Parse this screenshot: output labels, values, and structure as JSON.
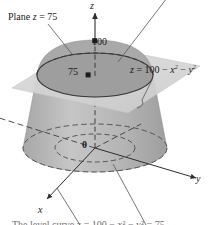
{
  "figure": {
    "labels": {
      "plane_label": "Plane z = 75",
      "surface_equation_lhs": "z = 100 − x",
      "surface_equation_mid": " − y",
      "exp_x": "2",
      "exp_y": "2",
      "apex_value": "100",
      "plane_value": "75",
      "origin": "0",
      "axis_z": "z",
      "axis_y": "y",
      "axis_x": "x",
      "caption": "The level curve z = 100 − x² − y² = 75"
    },
    "colors": {
      "plane_fill": "#d4d4d4",
      "paraboloid_fill": "#b9b9b9",
      "paraboloid_cap_fill": "#a8a8a8",
      "disk_fill": "#9f9f9f",
      "stroke": "#3a3a3a",
      "dash": "#4a4a4a",
      "leader": "#555555",
      "text": "#1a1a1a",
      "background": "#ffffff"
    },
    "geometry": {
      "origin_px": [
        95,
        148
      ],
      "apex_px": [
        95,
        41
      ],
      "plane_z_px": 75,
      "ellipse_cut_rx": 58,
      "ellipse_cut_ry": 22,
      "base_ellipse_rx": 72,
      "base_ellipse_ry": 24,
      "inner_dashed_rx": 40,
      "inner_dashed_ry": 14
    }
  }
}
